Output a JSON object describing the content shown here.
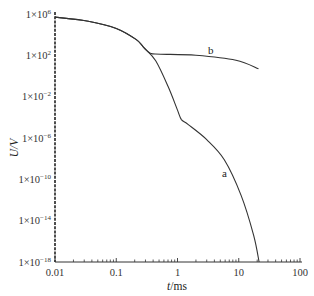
{
  "chart_data": {
    "type": "line",
    "title": "",
    "xlabel": "t/ms",
    "ylabel": "U/V",
    "xscale": "log",
    "yscale": "log",
    "xlim": [
      0.01,
      100
    ],
    "ylim": [
      1e-18,
      1000000.0
    ],
    "grid": false,
    "legend": "none (inline curve labels)",
    "x_ticks": [
      "0.01",
      "0.1",
      "1",
      "10",
      "100"
    ],
    "y_ticks": [
      {
        "base": "1×10",
        "exp": "6"
      },
      {
        "base": "1×10",
        "exp": "2"
      },
      {
        "base": "1×10",
        "exp": "−2"
      },
      {
        "base": "1×10",
        "exp": "−6"
      },
      {
        "base": "1×10",
        "exp": "−10"
      },
      {
        "base": "1×10",
        "exp": "−14"
      },
      {
        "base": "1×10",
        "exp": "−18"
      }
    ],
    "series": [
      {
        "name": "a",
        "x": [
          0.01,
          0.035,
          0.1,
          0.21,
          0.28,
          0.44,
          0.7,
          1.0,
          1.16,
          1.5,
          3.0,
          5.8,
          10.9,
          17.5,
          21.5
        ],
        "y": [
          500000.0,
          200000.0,
          40000.0,
          3500.0,
          600.0,
          30.0,
          0.1,
          0.0005,
          6e-05,
          2e-05,
          7e-07,
          8e-09,
          3e-12,
          4e-16,
          1e-18
        ]
      },
      {
        "name": "b",
        "x": [
          0.01,
          0.035,
          0.1,
          0.21,
          0.28,
          0.36,
          0.53,
          2.0,
          9.0,
          21.0
        ],
        "y": [
          500000.0,
          200000.0,
          40000.0,
          3500.0,
          600.0,
          160.0,
          130.0,
          100.0,
          33.0,
          5.0
        ]
      }
    ],
    "annotations": [
      {
        "text": "a",
        "near": "curve a at t≈4 ms"
      },
      {
        "text": "b",
        "near": "curve b at t≈3 ms"
      }
    ]
  }
}
